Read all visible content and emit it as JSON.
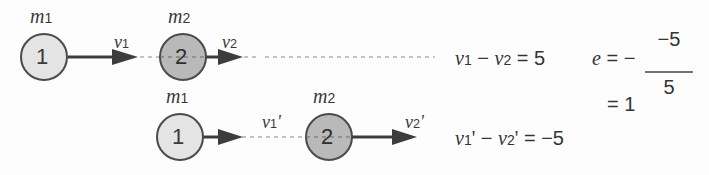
{
  "diagram": {
    "type": "collision-coefficient-of-restitution",
    "before": {
      "ball1": {
        "label": "1",
        "mass": "m",
        "mass_sub": "1",
        "velocity": "v",
        "velocity_sub": "1",
        "fill": "#e4e4e4"
      },
      "ball2": {
        "label": "2",
        "mass": "m",
        "mass_sub": "2",
        "velocity": "v",
        "velocity_sub": "2",
        "fill": "#b9b9b9"
      },
      "relation": {
        "lhs_a": "v",
        "lhs_a_sub": "1",
        "minus": " − ",
        "lhs_b": "v",
        "lhs_b_sub": "2",
        "rhs": " = 5"
      }
    },
    "after": {
      "ball1": {
        "label": "1",
        "mass": "m",
        "mass_sub": "1",
        "velocity": "v",
        "velocity_sub": "1",
        "prime": "'",
        "fill": "#e4e4e4"
      },
      "ball2": {
        "label": "2",
        "mass": "m",
        "mass_sub": "2",
        "velocity": "v",
        "velocity_sub": "2",
        "prime": "'",
        "fill": "#b9b9b9"
      },
      "relation": {
        "lhs_a": "v",
        "lhs_a_sub": "1",
        "prime": "'",
        "minus": " − ",
        "lhs_b": "v",
        "lhs_b_sub": "2",
        "rhs": " = −5"
      }
    },
    "restitution": {
      "symbol": "e",
      "equals_neg": " = − ",
      "numerator": "−5",
      "denominator": "5",
      "result": "= 1"
    },
    "colors": {
      "stroke": "#4a4a4a",
      "arrow": "#3d3d3d",
      "dash": "#8a8a8a",
      "text": "#333333"
    }
  }
}
